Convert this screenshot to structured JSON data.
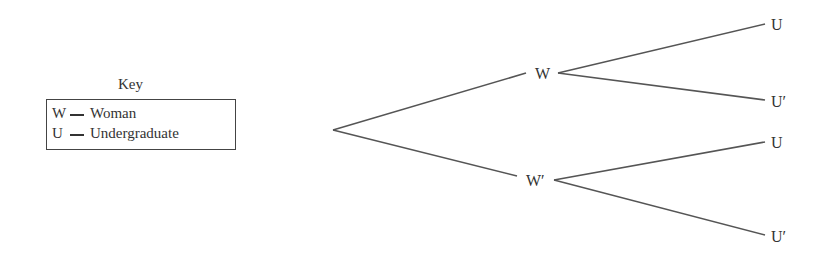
{
  "key": {
    "title": "Key",
    "entries": [
      {
        "symbol": "W",
        "meaning": "Woman"
      },
      {
        "symbol": "U",
        "meaning": "Undergraduate"
      }
    ]
  },
  "tree": {
    "level1": [
      {
        "label": "W",
        "children": [
          "U",
          "U′"
        ]
      },
      {
        "label": "W′",
        "children": [
          "U",
          "U′"
        ]
      }
    ]
  },
  "colors": {
    "line": "#555555",
    "text": "#333333"
  }
}
